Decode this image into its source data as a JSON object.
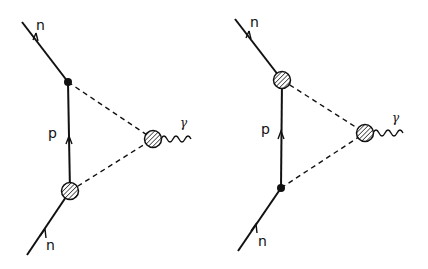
{
  "diagrams": [
    {
      "id": "left",
      "labels": {
        "n_top": "n",
        "p": "p",
        "n_bottom": "n",
        "photon": "γ"
      },
      "top_vertex": "point",
      "bottom_vertex": "blob",
      "photon_vertex": "blob"
    },
    {
      "id": "right",
      "labels": {
        "n_top": "n",
        "p": "p",
        "n_bottom": "n",
        "photon": "γ"
      },
      "top_vertex": "blob",
      "bottom_vertex": "point",
      "photon_vertex": "blob"
    }
  ],
  "colors": {
    "line": "#111111",
    "background": "#ffffff"
  }
}
